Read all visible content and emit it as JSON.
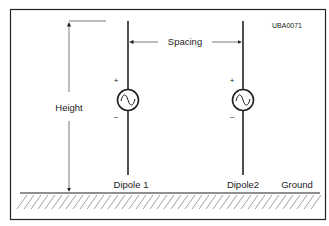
{
  "figure_id": "UBA0071",
  "labels": {
    "height": "Height",
    "spacing": "Spacing",
    "dipole1": "Dipole 1",
    "dipole2": "Dipole2",
    "ground": "Ground",
    "plus": "+",
    "minus": "–"
  },
  "icons": {
    "source": "ac-source-icon"
  },
  "colors": {
    "stroke": "#222222",
    "thin": "#444444",
    "hatch": "#888888",
    "background": "#ffffff"
  }
}
